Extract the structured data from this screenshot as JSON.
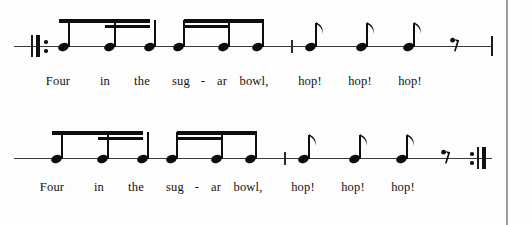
{
  "page": {
    "background_color": "#fdfdfd",
    "ink_color": "#0d0d0d",
    "staff_color": "#3b3b3b",
    "page_edge_color": "#9b9b9b"
  },
  "notation": {
    "staff_type": "single-line rhythm staff",
    "systems": [
      {
        "id": "system-1",
        "start_barline": "start-repeat",
        "end_barline": "thin",
        "mid_barline": "tick",
        "beam_groups": [
          {
            "id": "beam-group-1",
            "notes": [
              "eighth",
              "sixteenth",
              "sixteenth"
            ],
            "primary_beam": "all-three",
            "secondary_beam": "notes-2-3"
          },
          {
            "id": "beam-group-2",
            "notes": [
              "sixteenth",
              "sixteenth",
              "eighth"
            ],
            "primary_beam": "all-three",
            "secondary_beam": "notes-1-2"
          }
        ],
        "flagged_notes": [
          "eighth",
          "eighth",
          "eighth"
        ],
        "rest": "eighth-rest",
        "lyrics": [
          {
            "text": "Four",
            "x": 58
          },
          {
            "text": "in",
            "x": 105
          },
          {
            "text": "the",
            "x": 142
          },
          {
            "text": "sug",
            "x": 181
          },
          {
            "text": "-",
            "x": 203
          },
          {
            "text": "ar",
            "x": 222
          },
          {
            "text": "bowl,",
            "x": 254
          },
          {
            "text": "hop!",
            "x": 310
          },
          {
            "text": "hop!",
            "x": 360
          },
          {
            "text": "hop!",
            "x": 410
          }
        ]
      },
      {
        "id": "system-2",
        "start_barline": "none",
        "end_barline": "end-repeat",
        "mid_barline": "tick",
        "beam_groups": [
          {
            "id": "beam-group-3",
            "notes": [
              "eighth",
              "sixteenth",
              "sixteenth"
            ],
            "primary_beam": "all-three",
            "secondary_beam": "notes-2-3"
          },
          {
            "id": "beam-group-4",
            "notes": [
              "sixteenth",
              "sixteenth",
              "eighth"
            ],
            "primary_beam": "all-three",
            "secondary_beam": "notes-1-2"
          }
        ],
        "flagged_notes": [
          "eighth",
          "eighth",
          "eighth"
        ],
        "rest": "eighth-rest",
        "lyrics": [
          {
            "text": "Four",
            "x": 52
          },
          {
            "text": "in",
            "x": 99
          },
          {
            "text": "the",
            "x": 136
          },
          {
            "text": "sug",
            "x": 175
          },
          {
            "text": "-",
            "x": 197
          },
          {
            "text": "ar",
            "x": 216
          },
          {
            "text": "bowl,",
            "x": 248
          },
          {
            "text": "hop!",
            "x": 303
          },
          {
            "text": "hop!",
            "x": 353
          },
          {
            "text": "hop!",
            "x": 403
          }
        ]
      }
    ]
  },
  "layout": {
    "system_1_top": 10,
    "system_2_top": 122,
    "lyrics_1_top": 74,
    "lyrics_2_top": 180,
    "staff_y": 46,
    "page_edge_x": 506,
    "system1": {
      "staff_left": 14,
      "staff_right": 492,
      "repeat_thin_x": 31,
      "repeat_thick_x": 36,
      "repeat_dot_x": 44,
      "group1_note_x": [
        58,
        104,
        144
      ],
      "group2_note_x": [
        183,
        213,
        248
      ],
      "mid_bar_x": 291,
      "flag_note_x": [
        305,
        356,
        403
      ],
      "rest_x": 450,
      "end_bar_x": 491
    },
    "system2": {
      "staff_left": 14,
      "staff_right": 492,
      "group1_note_x": [
        51,
        98,
        137
      ],
      "group2_note_x": [
        176,
        206,
        241
      ],
      "mid_bar_x": 284,
      "flag_note_x": [
        298,
        349,
        396
      ],
      "rest_x": 441,
      "repeat_dot_x": 470,
      "repeat_thin_x": 477,
      "repeat_thick_x": 482
    }
  }
}
